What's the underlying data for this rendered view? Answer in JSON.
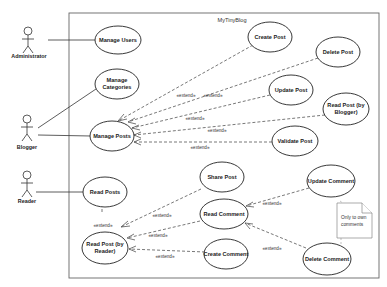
{
  "system": {
    "title": "MyTinyBlog"
  },
  "actors": [
    {
      "id": "administrator",
      "label": "Administrator"
    },
    {
      "id": "blogger",
      "label": "Blogger"
    },
    {
      "id": "reader",
      "label": "Reader"
    }
  ],
  "use_cases": {
    "manage_users": [
      "Manage Users"
    ],
    "manage_categories": [
      "Manage",
      "Categories"
    ],
    "manage_posts": [
      "Manage Posts"
    ],
    "create_post": [
      "Create Post"
    ],
    "delete_post": [
      "Delete Post"
    ],
    "update_post": [
      "Update Post"
    ],
    "read_post_blogger": [
      "Read Post (by",
      "Blogger)"
    ],
    "validate_post": [
      "Validate Post"
    ],
    "read_posts": [
      "Read Posts"
    ],
    "read_post_reader": [
      "Read Post (by",
      "Reader)"
    ],
    "share_post": [
      "Share Post"
    ],
    "read_comment": [
      "Read Comment"
    ],
    "create_comment": [
      "Create Comment"
    ],
    "update_comment": [
      "Update Comment"
    ],
    "delete_comment": [
      "Delete Comment"
    ]
  },
  "relations": {
    "extend_label": "«extend»"
  },
  "note": {
    "lines": [
      "Only to own",
      "comments"
    ]
  }
}
